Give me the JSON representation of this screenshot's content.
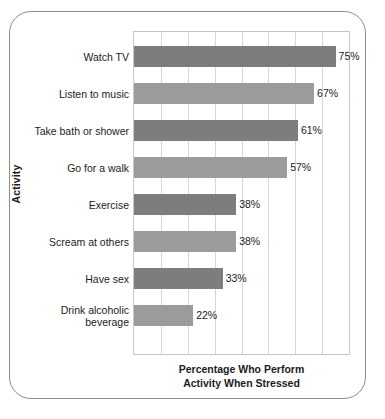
{
  "chart_data": {
    "type": "bar",
    "orientation": "horizontal",
    "title": "",
    "xlabel": "Percentage Who Perform\nActivity When Stressed",
    "ylabel": "Activity",
    "xlim": [
      0,
      80
    ],
    "grid": true,
    "gridlines": [
      0,
      10,
      20,
      30,
      40,
      50,
      60,
      70,
      80
    ],
    "legend": "none",
    "categories": [
      "Watch TV",
      "Listen to music",
      "Take bath or shower",
      "Go for a walk",
      "Exercise",
      "Scream at others",
      "Have sex",
      "Drink alcoholic\nbeverage"
    ],
    "values": [
      75,
      67,
      61,
      57,
      38,
      38,
      33,
      22
    ],
    "value_labels": [
      "75%",
      "67%",
      "61%",
      "57%",
      "38%",
      "38%",
      "33%",
      "22%"
    ],
    "bar_colors": [
      "#7d7d7d",
      "#9b9b9b",
      "#7d7d7d",
      "#9b9b9b",
      "#7d7d7d",
      "#9b9b9b",
      "#7d7d7d",
      "#9b9b9b"
    ]
  },
  "style": {
    "frame_color": "#8c8c8c",
    "grid_color": "#d6d6d6",
    "axis_color": "#c9c9c9",
    "text_color": "#1c1c1c",
    "background": "#ffffff"
  }
}
